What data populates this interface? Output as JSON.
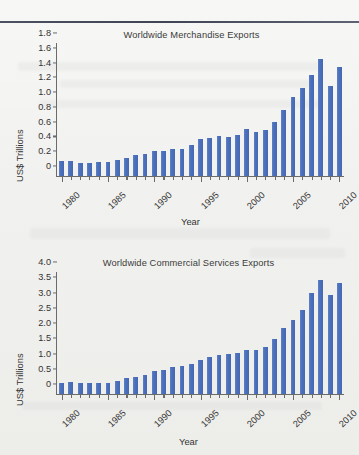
{
  "page": {
    "divider": "horizontal-rule"
  },
  "chart_data": [
    {
      "id": "merchandise",
      "type": "bar",
      "title": "Worldwide Merchandise Exports",
      "xlabel": "Year",
      "ylabel": "US$ Trillions",
      "ylim": [
        0,
        1.8
      ],
      "yticks": [
        "0",
        "0.2",
        "0.4",
        "0.6",
        "0.8",
        "1.0",
        "1.2",
        "1.4",
        "1.6",
        "1.8"
      ],
      "ytickvalues": [
        0,
        0.2,
        0.4,
        0.6,
        0.8,
        1.0,
        1.2,
        1.4,
        1.6,
        1.8
      ],
      "xticklabels": [
        "1980",
        "1985",
        "1990",
        "1995",
        "2000",
        "2005",
        "2010"
      ],
      "grid": false,
      "legend": "none",
      "categories": [
        1980,
        1981,
        1982,
        1983,
        1984,
        1985,
        1986,
        1987,
        1988,
        1989,
        1990,
        1991,
        1992,
        1993,
        1994,
        1995,
        1996,
        1997,
        1998,
        1999,
        2000,
        2001,
        2002,
        2003,
        2004,
        2005,
        2006,
        2007,
        2008,
        2009,
        2010
      ],
      "values": [
        0.2,
        0.2,
        0.18,
        0.18,
        0.19,
        0.19,
        0.21,
        0.24,
        0.28,
        0.3,
        0.34,
        0.34,
        0.36,
        0.37,
        0.42,
        0.5,
        0.52,
        0.54,
        0.53,
        0.55,
        0.63,
        0.6,
        0.62,
        0.73,
        0.9,
        1.07,
        1.19,
        1.37,
        1.58,
        1.22,
        1.47
      ]
    },
    {
      "id": "services",
      "type": "bar",
      "title": "Worldwide Commercial Services Exports",
      "xlabel": "Year",
      "ylabel": "US$ Trillions",
      "ylim": [
        0,
        4.0
      ],
      "yticks": [
        "0",
        "0.5",
        "1.0",
        "1.5",
        "2.0",
        "2.5",
        "3.0",
        "3.5",
        "4.0"
      ],
      "ytickvalues": [
        0,
        0.5,
        1.0,
        1.5,
        2.0,
        2.5,
        3.0,
        3.5,
        4.0
      ],
      "xticklabels": [
        "1980",
        "1985",
        "1990",
        "1995",
        "2000",
        "2005",
        "2010"
      ],
      "grid": false,
      "legend": "none",
      "categories": [
        1980,
        1981,
        1982,
        1983,
        1984,
        1985,
        1986,
        1987,
        1988,
        1989,
        1990,
        1991,
        1992,
        1993,
        1994,
        1995,
        1996,
        1997,
        1998,
        1999,
        2000,
        2001,
        2002,
        2003,
        2004,
        2005,
        2006,
        2007,
        2008,
        2009,
        2010
      ],
      "values": [
        0.35,
        0.38,
        0.35,
        0.35,
        0.35,
        0.37,
        0.44,
        0.51,
        0.57,
        0.63,
        0.77,
        0.8,
        0.89,
        0.91,
        1.0,
        1.13,
        1.22,
        1.28,
        1.3,
        1.35,
        1.45,
        1.44,
        1.55,
        1.79,
        2.17,
        2.42,
        2.76,
        3.3,
        3.75,
        3.24,
        3.63
      ]
    }
  ],
  "colors": {
    "bar": "#4f73be",
    "axis": "#6b6b6b",
    "text": "#333333",
    "rule": "#434958",
    "background": "#f2f2f0"
  }
}
